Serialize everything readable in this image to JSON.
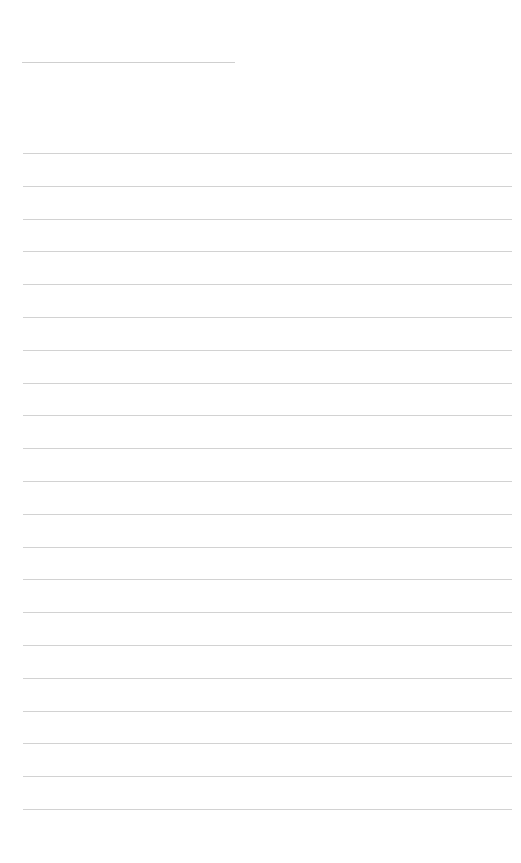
{
  "document": {
    "type": "ruled-blank-page",
    "header_line": {
      "present": true
    },
    "ruled_lines": {
      "count": 21,
      "first_y": 153,
      "spacing": 32.8,
      "color": "#d2d2d2"
    },
    "text_content": []
  }
}
